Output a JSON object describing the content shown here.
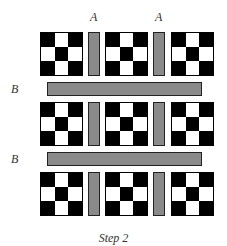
{
  "diagram": {
    "labels": {
      "a1": "A",
      "a2": "A",
      "b1": "B",
      "b2": "B"
    },
    "caption": "Step 2",
    "colors": {
      "dark": "#000000",
      "light": "#ffffff",
      "sashing": "#8a8a8a"
    },
    "block_pattern": [
      [
        "b",
        "w",
        "b"
      ],
      [
        "w",
        "b",
        "w"
      ],
      [
        "b",
        "w",
        "b"
      ]
    ],
    "rows": 3,
    "blocks_per_row": 3,
    "vertical_sashing_per_row": 2,
    "horizontal_sashing_count": 2
  }
}
